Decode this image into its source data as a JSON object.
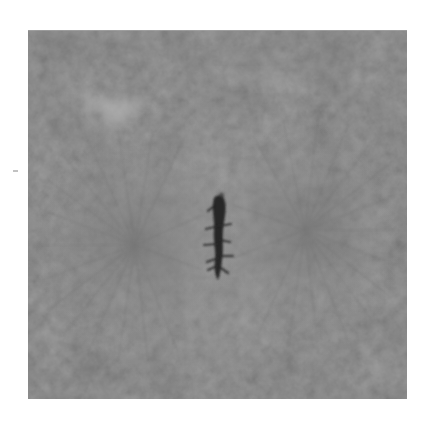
{
  "image": {
    "kind": "grayscale light micrograph",
    "subject": "dividing cell in metaphase with central chromosome plate and two radial spindle poles",
    "frame": {
      "x": 28,
      "y": 30,
      "width": 379,
      "height": 369
    },
    "background_color": "#ffffff",
    "base_gray": "#8e8e8e",
    "light_gray": "#b4b4b4",
    "dark_gray": "#6a6a6a",
    "chromosome_color": "#1e1e1e",
    "spindle_poles": [
      {
        "name": "left-pole",
        "cx": 107,
        "cy": 215,
        "r": 110
      },
      {
        "name": "right-pole",
        "cx": 277,
        "cy": 200,
        "r": 110
      }
    ],
    "chromosome_plate": {
      "cx": 190,
      "cy": 205,
      "height": 80
    },
    "light_wedge": {
      "x": 40,
      "y": 60
    },
    "stray_speck": {
      "x": 13,
      "y": 170,
      "width": 5
    }
  }
}
